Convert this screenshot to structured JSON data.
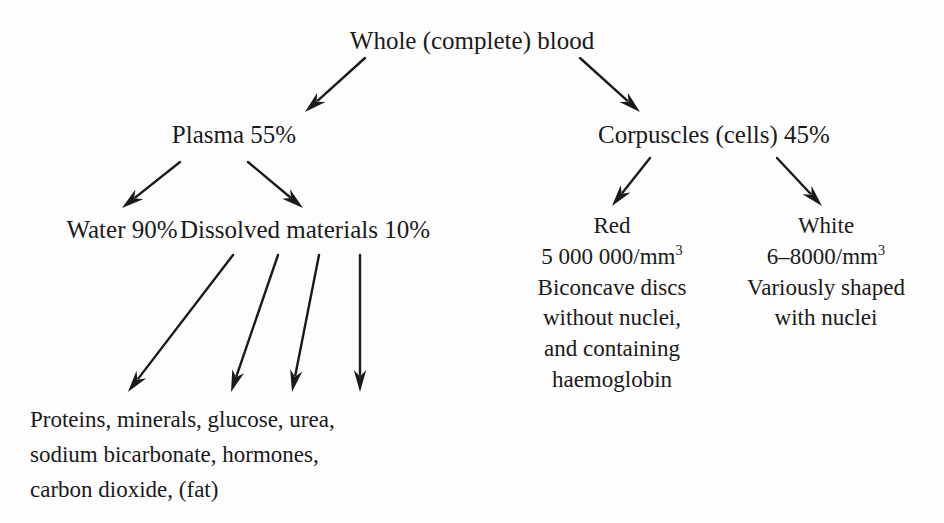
{
  "diagram": {
    "background_color": "#fdfdfd",
    "text_color": "#1a1a1a",
    "arrow_color": "#1a1a1a"
  },
  "nodes": {
    "root": {
      "label": "Whole (complete) blood"
    },
    "plasma": {
      "label": "Plasma 55%"
    },
    "corpuscles": {
      "label": "Corpuscles (cells) 45%"
    },
    "water": {
      "label": "Water 90%"
    },
    "dissolved": {
      "label": "Dissolved materials 10%"
    },
    "red": {
      "title": "Red",
      "count_value": "5 000 000/mm",
      "count_exponent": "3",
      "line1": "Biconcave discs",
      "line2": "without nuclei,",
      "line3": "and containing",
      "line4": "haemoglobin"
    },
    "white": {
      "title": "White",
      "count_value": "6–8000/mm",
      "count_exponent": "3",
      "line1": "Variously shaped",
      "line2": "with nuclei"
    },
    "dissolved_contents": {
      "line1": "Proteins, minerals, glucose, urea,",
      "line2": "sodium bicarbonate, hormones,",
      "line3": "carbon dioxide, (fat)"
    }
  },
  "arrows": [
    {
      "name": "root-to-plasma",
      "from": [
        365,
        58
      ],
      "to": [
        305,
        112
      ]
    },
    {
      "name": "root-to-corpuscles",
      "from": [
        580,
        58
      ],
      "to": [
        640,
        112
      ]
    },
    {
      "name": "plasma-to-water",
      "from": [
        180,
        162
      ],
      "to": [
        122,
        208
      ]
    },
    {
      "name": "plasma-to-dissolved",
      "from": [
        248,
        162
      ],
      "to": [
        303,
        208
      ]
    },
    {
      "name": "corpuscles-to-red",
      "from": [
        650,
        158
      ],
      "to": [
        612,
        206
      ]
    },
    {
      "name": "corpuscles-to-white",
      "from": [
        777,
        158
      ],
      "to": [
        822,
        206
      ]
    },
    {
      "name": "dissolved-to-contents-1",
      "from": [
        233,
        255
      ],
      "to": [
        128,
        392
      ]
    },
    {
      "name": "dissolved-to-contents-2",
      "from": [
        278,
        255
      ],
      "to": [
        231,
        392
      ]
    },
    {
      "name": "dissolved-to-contents-3",
      "from": [
        319,
        255
      ],
      "to": [
        292,
        392
      ]
    },
    {
      "name": "dissolved-to-contents-4",
      "from": [
        360,
        255
      ],
      "to": [
        360,
        392
      ]
    }
  ]
}
